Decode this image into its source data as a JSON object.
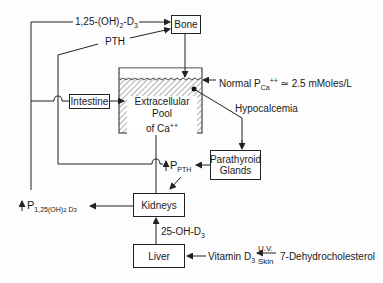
{
  "diagram": {
    "nodes": {
      "bone": "Bone",
      "intestine": "Intestine",
      "pool_line1": "Extracellular Pool",
      "pool_line2": "of Ca",
      "pool_sup": "++",
      "parathyroid_line1": "Parathyroid",
      "parathyroid_line2": "Glands",
      "kidneys": "Kidneys",
      "liver": "Liver"
    },
    "labels": {
      "vitd_top_main": "1,25-(OH)",
      "vitd_top_sub1": "2",
      "vitd_top_mid": "-D",
      "vitd_top_sub2": "3",
      "pth_top": "PTH",
      "normal_prefix": "Normal  P",
      "normal_sub": "Ca",
      "normal_sup": "++",
      "normal_value": " ≃ 2.5 mMoles/L",
      "hypocalcemia": "Hypocalcemia",
      "ppth_arrow": "↑",
      "ppth_p": "P",
      "ppth_sub": "PTH",
      "p125_arrow": "↑",
      "p125_p": "P",
      "p125_sub": "1,25(OH)",
      "p125_sub2": "2",
      "p125_d": " D",
      "p125_d_sub": "3",
      "oh_d3": "25-OH-D",
      "oh_d3_sub": "3",
      "vitamin": "Vitamin  D",
      "vitamin_sub": "3",
      "uv": "U.V.",
      "skin": "Skin",
      "dehydro": "7-Dehydrocholesterol"
    },
    "colors": {
      "line": "#222222",
      "hatch": "#555555",
      "background": "#fdfdfd"
    }
  }
}
